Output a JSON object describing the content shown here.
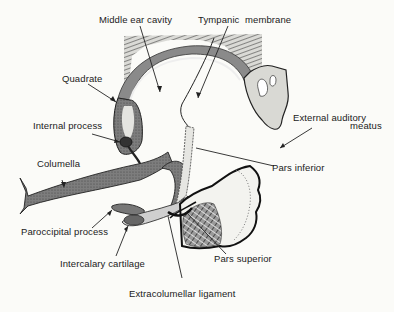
{
  "figure": {
    "type": "anatomical-diagram",
    "colors": {
      "ink": "#1a1a1a",
      "bone_fill": "#8a8a8a",
      "cartilage_fill": "#cfcfcf",
      "tissue_hatch": "#6a6a6a",
      "background": "#fbfbf8"
    }
  },
  "labels": {
    "middle_ear_cavity": "Middle ear cavity",
    "tympanic": "Tympanic",
    "membrane": "membrane",
    "quadrate": "Quadrate",
    "internal_process": "Internal process",
    "external_auditory": "External auditory",
    "meatus": "meatus",
    "columella": "Columella",
    "pars_inferior": "Pars inferior",
    "paroccipital_process": "Paroccipital process",
    "intercalary_cartilage": "Intercalary cartilage",
    "pars_superior": "Pars superior",
    "extracolumellar_ligament": "Extracolumellar ligament"
  }
}
